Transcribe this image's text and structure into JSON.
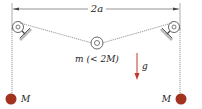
{
  "diagram": {
    "dimension_label": "2a",
    "center_mass_label": "m (< 2M)",
    "gravity_label": "g",
    "left_mass_label": "M",
    "right_mass_label": "M",
    "colors": {
      "mass_fill": "#a0321e",
      "gravity_arrow": "#c0392b",
      "string": "#555555",
      "pulley": "#444444",
      "support_shadow": "#999999"
    }
  }
}
